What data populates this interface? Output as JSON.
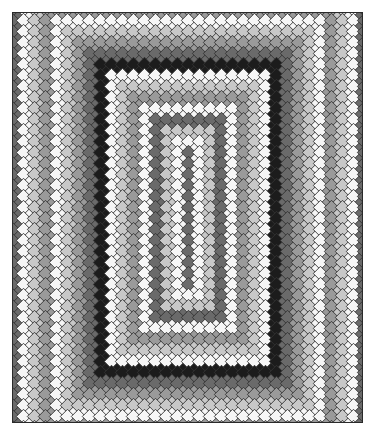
{
  "image": {
    "title": "Concentric diamond mosaic quilt",
    "description": "Grayscale quilt made of diamond tiles arranged in concentric rectangular bands around a dark central column"
  },
  "quilt": {
    "frame": {
      "x": 12,
      "y": 12,
      "width": 351,
      "height": 411
    },
    "cell_pitch_x": 11,
    "cell_pitch_y": 11,
    "diamond_size": 7.2,
    "outline_color": "#333333",
    "background_color": "#3a3a3a",
    "palette": {
      "white": "#f6f6f6",
      "light": "#c8c8c8",
      "mid": "#9a9a9a",
      "dark": "#6a6a6a",
      "black": "#1c1c1c"
    },
    "ring_sequence": [
      "dark",
      "white",
      "light",
      "mid",
      "white",
      "light",
      "mid",
      "dark",
      "black",
      "white",
      "light",
      "mid",
      "white",
      "dark",
      "light",
      "white",
      "mid",
      "dark",
      "white",
      "light",
      "mid",
      "white",
      "dark",
      "dark",
      "dark",
      "dark",
      "dark"
    ],
    "center_column": {
      "half_width_cells": 0,
      "half_height_cells": 6,
      "color": "dark"
    }
  }
}
